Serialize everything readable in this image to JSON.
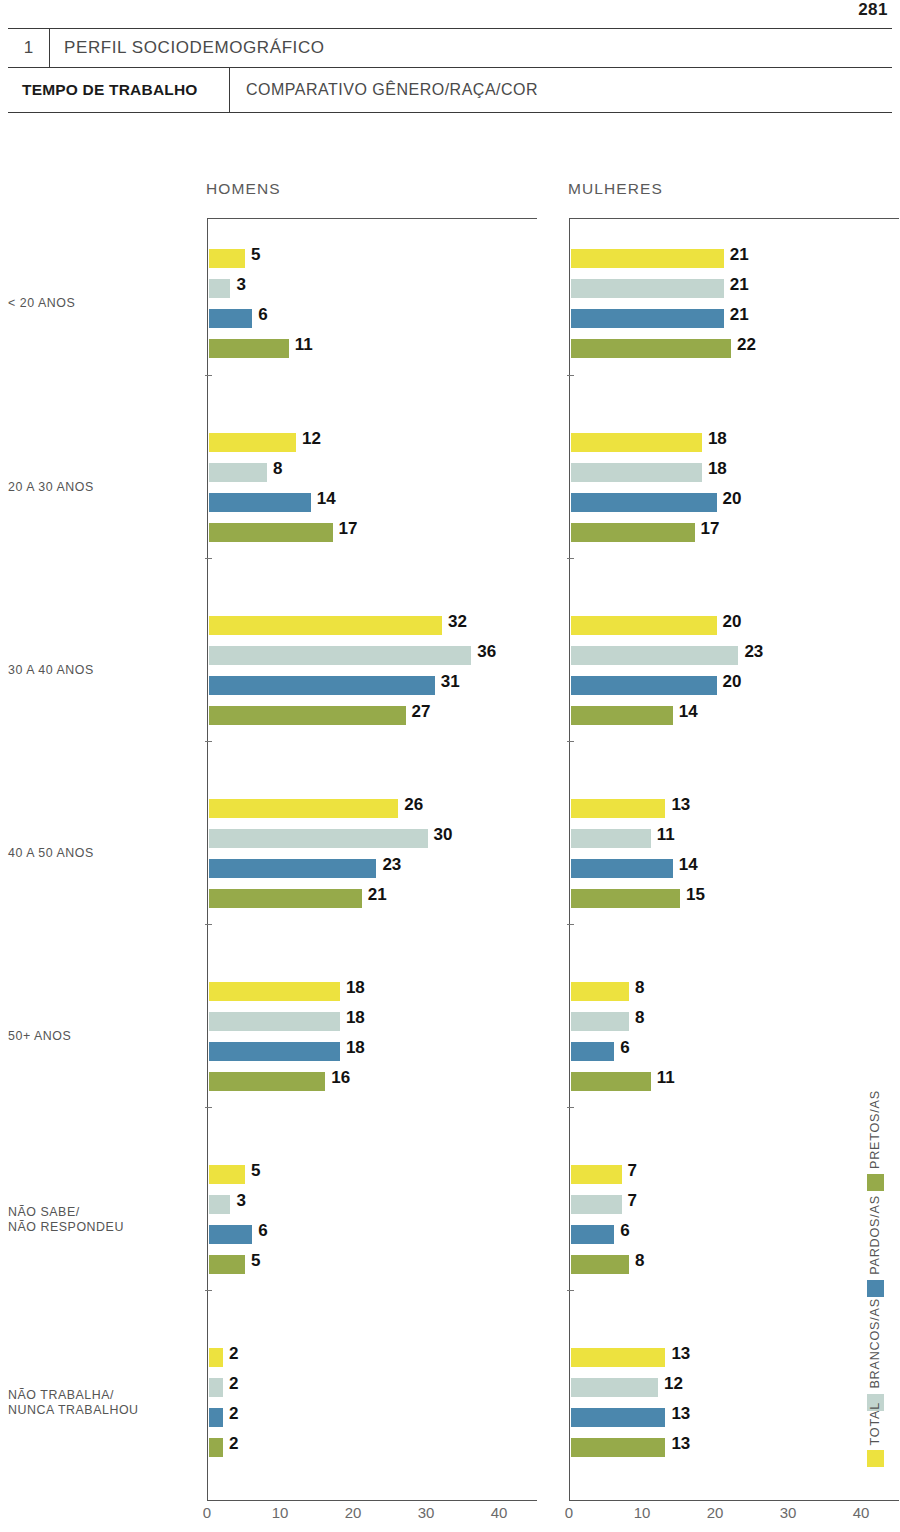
{
  "page_number": "281",
  "header": {
    "section_number": "1",
    "section_title": "PERFIL SOCIODEMOGRÁFICO",
    "topic_label": "TEMPO DE TRABALHO",
    "topic_subtitle": "COMPARATIVO GÊNERO/RAÇA/COR"
  },
  "legend": {
    "items": [
      {
        "label": "PRETOS/AS",
        "color": "#96aa4a"
      },
      {
        "label": "PARDOS/AS",
        "color": "#4b87ad"
      },
      {
        "label": "BRANCOS/AS",
        "color": "#c2d5cf"
      },
      {
        "label": "TOTAL",
        "color": "#ede23f"
      }
    ]
  },
  "chart_data": {
    "type": "bar",
    "orientation": "horizontal",
    "panels": [
      "HOMENS",
      "MULHERES"
    ],
    "categories": [
      "< 20 ANOS",
      "20 A 30 ANOS",
      "30 A 40 ANOS",
      "40 A 50 ANOS",
      "50+ ANOS",
      "NÃO SABE/\nNÃO RESPONDEU",
      "NÃO TRABALHA/\nNUNCA TRABALHOU"
    ],
    "category_labels": [
      [
        "< 20 ANOS"
      ],
      [
        "20 A 30 ANOS"
      ],
      [
        "30 A 40 ANOS"
      ],
      [
        "40 A 50 ANOS"
      ],
      [
        "50+ ANOS"
      ],
      [
        "NÃO SABE/",
        "NÃO RESPONDEU"
      ],
      [
        "NÃO TRABALHA/",
        "NUNCA TRABALHOU"
      ]
    ],
    "series_order": [
      "TOTAL",
      "BRANCOS/AS",
      "PARDOS/AS",
      "PRETOS/AS"
    ],
    "series_colors": {
      "TOTAL": "#ede23f",
      "BRANCOS/AS": "#c2d5cf",
      "PARDOS/AS": "#4b87ad",
      "PRETOS/AS": "#96aa4a"
    },
    "xlabel": "",
    "ylabel": "",
    "xlim": [
      0,
      45
    ],
    "xticks": [
      0,
      10,
      20,
      30,
      40
    ],
    "xtick_labels": [
      "0",
      "10",
      "20",
      "30",
      "40"
    ],
    "grid": false,
    "legend_position": "right-vertical",
    "units": "%",
    "HOMENS": {
      "TOTAL": [
        5,
        12,
        32,
        26,
        18,
        5,
        2
      ],
      "BRANCOS/AS": [
        3,
        8,
        36,
        30,
        18,
        3,
        2
      ],
      "PARDOS/AS": [
        6,
        14,
        31,
        23,
        18,
        6,
        2
      ],
      "PRETOS/AS": [
        11,
        17,
        27,
        21,
        16,
        5,
        2
      ]
    },
    "MULHERES": {
      "TOTAL": [
        21,
        18,
        20,
        13,
        8,
        7,
        13
      ],
      "BRANCOS/AS": [
        21,
        18,
        23,
        11,
        8,
        7,
        12
      ],
      "PARDOS/AS": [
        21,
        20,
        20,
        14,
        6,
        6,
        13
      ],
      "PRETOS/AS": [
        22,
        17,
        14,
        15,
        11,
        8,
        13
      ]
    }
  }
}
